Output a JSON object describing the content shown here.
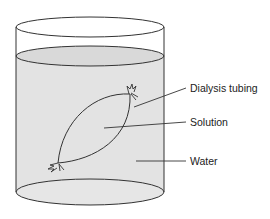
{
  "diagram": {
    "type": "beaker-with-dialysis-bag",
    "labels": {
      "tubing": "Dialysis tubing",
      "solution": "Solution",
      "water": "Water"
    },
    "colors": {
      "water_fill": "#e3e3e3",
      "water_surface": "#d9d9d9",
      "outline": "#333333",
      "background": "#ffffff"
    }
  }
}
